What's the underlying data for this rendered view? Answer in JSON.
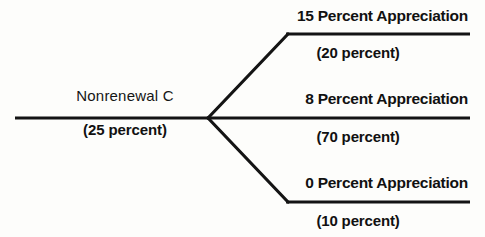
{
  "diagram": {
    "type": "decision-tree",
    "orientation": "left-to-right",
    "stroke_color": "#141414",
    "background_color": "#fdfdfb",
    "root": {
      "label": "Nonrenewal C",
      "probability": "(25 percent)"
    },
    "branches": [
      {
        "id": "top",
        "label": "15 Percent Appreciation",
        "probability": "(20 percent)"
      },
      {
        "id": "middle",
        "label": "8 Percent Appreciation",
        "probability": "(70 percent)"
      },
      {
        "id": "bottom",
        "label": "0 Percent Appreciation",
        "probability": "(10 percent)"
      }
    ]
  }
}
